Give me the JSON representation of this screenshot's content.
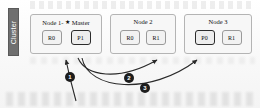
{
  "figure": {
    "cluster_label": "Cluster",
    "background_color": "#fdfdfd",
    "bar_color": "#6f6f6f"
  },
  "nodes": [
    {
      "id": "node-1",
      "title": "Node 1-",
      "star_icon": "★",
      "role_label": "Master",
      "shards": [
        {
          "label": "R0",
          "kind": "replica"
        },
        {
          "label": "P1",
          "kind": "primary"
        }
      ]
    },
    {
      "id": "node-2",
      "title": "Node 2",
      "star_icon": "",
      "role_label": "",
      "shards": [
        {
          "label": "R0",
          "kind": "replica"
        },
        {
          "label": "R1",
          "kind": "replica"
        }
      ]
    },
    {
      "id": "node-3",
      "title": "Node 3",
      "star_icon": "",
      "role_label": "",
      "shards": [
        {
          "label": "P0",
          "kind": "primary"
        },
        {
          "label": "R1",
          "kind": "replica"
        }
      ]
    }
  ],
  "steps": [
    {
      "number": "1",
      "target": "P1 on Node 1"
    },
    {
      "number": "2",
      "target": "R1 on Node 2"
    },
    {
      "number": "3",
      "target": "P0 on Node 3"
    }
  ],
  "arrow_color": "#2a2a2a"
}
